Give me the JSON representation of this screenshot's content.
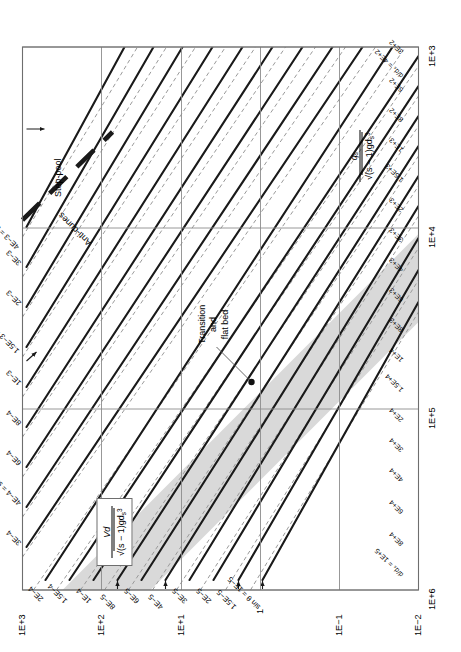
{
  "chart_data": {
    "type": "line",
    "title": "",
    "xlabel": "Vd / sqrt((s-1) g d_s^3)",
    "ylabel": "q_s / sqrt((s-1) g d_s^3)",
    "xlabel_parts": {
      "num": "Vd",
      "den_prefix": "(s − 1)gd",
      "den_sub": "s",
      "den_sup": "3"
    },
    "ylabel_parts": {
      "num": "q",
      "num_sub": "s",
      "den_prefix": "(s − 1)gd",
      "den_sub": "s",
      "den_sup": "3"
    },
    "x_scale": "log",
    "y_scale": "log",
    "xlim": [
      1000,
      1000000
    ],
    "ylim": [
      0.01,
      1000
    ],
    "xticks": [
      "1E+3",
      "1E+4",
      "1E+5",
      "1E+6"
    ],
    "yticks": [
      "1E−2",
      "1E−1",
      "1",
      "1E+1",
      "1E+2",
      "1E+3"
    ],
    "grid": true,
    "legend": "none",
    "family_labels": {
      "sin_theta": "sin θ",
      "d_over_ds": "d/d",
      "d_over_ds_sub": "s"
    },
    "sin_theta_curves": [
      {
        "label": "sin θ = 1E−5",
        "value": "1E-5",
        "has_arrow": true
      },
      {
        "label": "1.5E−5",
        "value": "1.5E-5",
        "has_arrow": true
      },
      {
        "label": "2E−5",
        "value": "2E-5",
        "has_arrow": false
      },
      {
        "label": "3E−5",
        "value": "3E-5",
        "has_arrow": false
      },
      {
        "label": "4E−5",
        "value": "4E-5",
        "has_arrow": true
      },
      {
        "label": "6E−5",
        "value": "6E-5",
        "has_arrow": false
      },
      {
        "label": "8E−5",
        "value": "8E-5",
        "has_arrow": true
      },
      {
        "label": "1E−4",
        "value": "1E-4",
        "has_arrow": false
      },
      {
        "label": "1.5E−4",
        "value": "1.5E-4",
        "has_arrow": false
      },
      {
        "label": "2E−4",
        "value": "2E-4",
        "has_arrow": false
      },
      {
        "label": "3E−4",
        "value": "3E-4",
        "has_arrow": false
      },
      {
        "label": "4E−4 = sin θ",
        "value": "4E-4",
        "has_arrow": true
      },
      {
        "label": "6E−4",
        "value": "6E-4",
        "has_arrow": false
      },
      {
        "label": "8E−4",
        "value": "8E-4",
        "has_arrow": false
      },
      {
        "label": "1E−3",
        "value": "1E-3",
        "has_arrow": false
      },
      {
        "label": "1.5E−3 = sin θ",
        "value": "1.5E-3",
        "has_arrow": false
      },
      {
        "label": "2E−3",
        "value": "2E-3",
        "has_arrow": false
      },
      {
        "label": "3E−3",
        "value": "3E-3",
        "has_arrow": false
      },
      {
        "label": "4E−3 = sin θ",
        "value": "4E-3",
        "has_arrow": true
      }
    ],
    "d_over_ds_curves": [
      {
        "label": "d/dₛ = 1E+5",
        "value": "1E+5"
      },
      {
        "label": "8E+4",
        "value": "8E+4"
      },
      {
        "label": "6E+4",
        "value": "6E+4"
      },
      {
        "label": "4E+4",
        "value": "4E+4"
      },
      {
        "label": "3E+4",
        "value": "3E+4"
      },
      {
        "label": "2E+4",
        "value": "2E+4"
      },
      {
        "label": "1.5E+4",
        "value": "1.5E+4"
      },
      {
        "label": "1E+4",
        "value": "1E+4"
      },
      {
        "label": "8E+3",
        "value": "8E+3"
      },
      {
        "label": "6E+3",
        "value": "6E+3"
      },
      {
        "label": "4E+3",
        "value": "4E+3"
      },
      {
        "label": "3E+3",
        "value": "3E+3"
      },
      {
        "label": "2E+3",
        "value": "2E+3"
      },
      {
        "label": "1.5E+3",
        "value": "1.5E+3"
      },
      {
        "label": "1E+3",
        "value": "1E+3"
      },
      {
        "label": "8E+2",
        "value": "8E+2"
      },
      {
        "label": "6E+2",
        "value": "6E+2"
      },
      {
        "label": "d/dₛ = 4E+2",
        "value": "4E+2"
      },
      {
        "label": "3E+2",
        "value": "3E+2"
      }
    ],
    "regions": [
      {
        "name": "anti-dunes",
        "label": "Anti-dunes"
      },
      {
        "name": "step-pool",
        "label": "Step-pool"
      },
      {
        "name": "transition-flat-bed",
        "label_line1": "Transition",
        "label_line2": "and",
        "label_line3": "flat bed"
      }
    ],
    "annotations": [
      {
        "name": "transition-band",
        "type": "shaded-band",
        "color": "#d9d9d9"
      },
      {
        "name": "regime-divider",
        "type": "thick-dashed-line",
        "color": "#1a1a1a"
      }
    ],
    "colors": {
      "solid_curve": "#1a1a1a",
      "dashed_curve": "#9a9a9a",
      "band": "#d9d9d9",
      "grid": "#8c8c8c",
      "frame": "#6e6e6e"
    }
  }
}
